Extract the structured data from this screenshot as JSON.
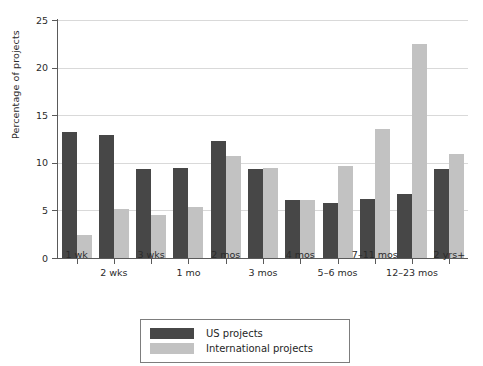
{
  "chart_data": {
    "type": "bar",
    "title": "",
    "subtitle": "",
    "xlabel": "",
    "ylabel": "Percentage of projects",
    "ylim": [
      0,
      25
    ],
    "ytick_values": [
      0,
      5,
      10,
      15,
      20,
      25
    ],
    "ytick_labels": [
      "0",
      "5",
      "10",
      "15",
      "20",
      "25"
    ],
    "grid": "horizontal",
    "legend_position": "bottom-center",
    "categories": [
      "1 wk",
      "2 wks",
      "3 wks",
      "1 mo",
      "2 mos",
      "3 mos",
      "4 mos",
      "5–6 mos",
      "7–11 mos",
      "12–23 mos",
      "2 yrs+"
    ],
    "series": [
      {
        "name": "US projects",
        "color": "#474747",
        "values": [
          13.2,
          12.9,
          9.3,
          9.5,
          12.3,
          9.3,
          6.1,
          5.8,
          6.2,
          6.7,
          9.4
        ]
      },
      {
        "name": "International projects",
        "color": "#c2c2c2",
        "values": [
          2.4,
          5.2,
          4.5,
          5.4,
          10.7,
          9.5,
          6.1,
          9.7,
          13.5,
          22.5,
          10.9
        ]
      }
    ]
  },
  "legend": {
    "items": [
      {
        "label": "US projects",
        "swatch": "us"
      },
      {
        "label": "International projects",
        "swatch": "intl"
      }
    ]
  },
  "colors": {
    "us_bar": "#474747",
    "intl_bar": "#c2c2c2",
    "axis": "#5a5a5a",
    "gridline": "#d9d9d9",
    "background": "#ffffff"
  }
}
